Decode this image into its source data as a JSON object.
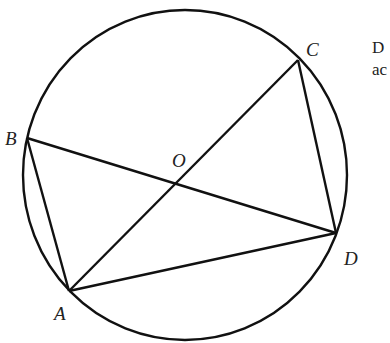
{
  "diagram": {
    "type": "circle-inscribed-quadrilateral",
    "circle": {
      "center_label": "O",
      "cx": 185,
      "cy": 175,
      "rx": 162,
      "ry": 165
    },
    "points": {
      "A": {
        "label": "A",
        "x": 69,
        "y": 291
      },
      "B": {
        "label": "B",
        "x": 27,
        "y": 138
      },
      "C": {
        "label": "C",
        "x": 298,
        "y": 60
      },
      "D": {
        "label": "D",
        "x": 336,
        "y": 233
      },
      "O": {
        "label": "O",
        "x": 182,
        "y": 178
      }
    },
    "segments": [
      "AB",
      "BD",
      "AC",
      "AD",
      "CD"
    ],
    "stroke_color": "#111111"
  },
  "side_text": {
    "line1": "D",
    "line2": "ac"
  }
}
